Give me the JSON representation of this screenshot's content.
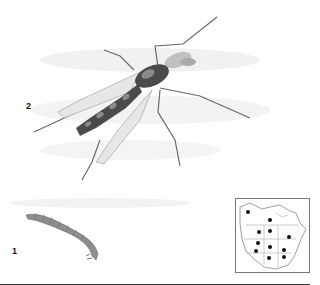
{
  "figure": {
    "labels": {
      "adult": "2",
      "larva": "1"
    },
    "subjects": {
      "adult": "adult-midge-illustration",
      "larva": "larva-illustration"
    },
    "range_map": {
      "region": "North America",
      "dots": [
        [
          12,
          13
        ],
        [
          34,
          21
        ],
        [
          23,
          33
        ],
        [
          34,
          32
        ],
        [
          53,
          38
        ],
        [
          22,
          44
        ],
        [
          34,
          48
        ],
        [
          48,
          51
        ],
        [
          20,
          52
        ],
        [
          33,
          59
        ],
        [
          48,
          58
        ]
      ]
    },
    "colors": {
      "body": "#4a4a4a",
      "body_band": "#8a8a8a",
      "wing": "#c8c8c8",
      "larva": "#8e8e8e",
      "wash": "#ececec"
    }
  }
}
